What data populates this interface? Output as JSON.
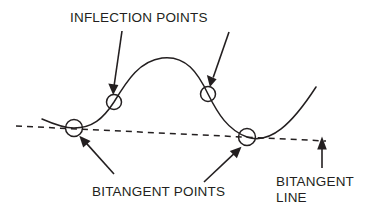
{
  "diagram": {
    "background_color": "#ffffff",
    "ink_color": "#231f20",
    "labels": {
      "inflection_points": "INFLECTION POINTS",
      "bitangent_points": "BITANGENT POINTS",
      "bitangent_line_line1": "BITANGENT",
      "bitangent_line_line2": "LINE"
    },
    "markers": {
      "inflection_left": {
        "cx": 114,
        "cy": 102,
        "r": 7.5
      },
      "inflection_right": {
        "cx": 208,
        "cy": 94,
        "r": 7.5
      },
      "bitangent_left": {
        "cx": 74,
        "cy": 128,
        "r": 8.5
      },
      "bitangent_right": {
        "cx": 247,
        "cy": 137,
        "r": 8.5
      }
    },
    "curve": {
      "description": "S-shaped cubic-like curve with a local maximum hump and a local minimum valley",
      "path": "M 42 119 C 58 126, 66 128, 74 128 C 92 128, 103 119, 114 102 C 128 79, 140 61, 162 58 C 186 55, 198 73, 208 94 C 218 114, 228 130, 247 137 C 270 145, 292 124, 316 87"
    },
    "bitangent_line": {
      "description": "Dashed straight line touching the curve at both bitangent points",
      "x1": 16,
      "y1": 126,
      "x2": 326,
      "y2": 141
    },
    "annotations": [
      {
        "name": "inflection-left-arrow",
        "from": {
          "x": 122,
          "y": 31
        },
        "to": {
          "x": 113,
          "y": 94
        }
      },
      {
        "name": "inflection-right-arrow",
        "from": {
          "x": 229,
          "y": 32
        },
        "to": {
          "x": 210,
          "y": 86
        }
      },
      {
        "name": "bitangent-left-arrow",
        "from": {
          "x": 114,
          "y": 174
        },
        "to": {
          "x": 79,
          "y": 135
        }
      },
      {
        "name": "bitangent-right-arrow",
        "from": {
          "x": 204,
          "y": 182
        },
        "to": {
          "x": 242,
          "y": 146
        }
      },
      {
        "name": "bitangent-line-arrow",
        "from": {
          "x": 322,
          "y": 168
        },
        "to": {
          "x": 322,
          "y": 137
        }
      }
    ],
    "text_positions": {
      "inflection_points": {
        "x": 70,
        "y": 22
      },
      "bitangent_points": {
        "x": 92,
        "y": 196
      },
      "bitangent_line_line1": {
        "x": 276,
        "y": 186
      },
      "bitangent_line_line2": {
        "x": 276,
        "y": 202
      }
    }
  }
}
